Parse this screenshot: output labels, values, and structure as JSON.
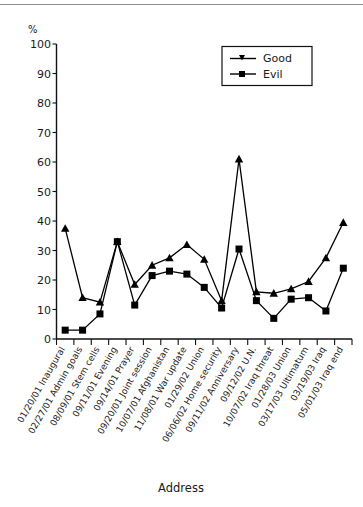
{
  "chart_data": {
    "type": "line",
    "title": "",
    "xlabel": "Address",
    "ylabel": "%",
    "ylim": [
      0,
      100
    ],
    "yticks": [
      0,
      10,
      20,
      30,
      40,
      50,
      60,
      70,
      80,
      90,
      100
    ],
    "grid": false,
    "legend_position": "top-right",
    "categories": [
      "01/20/01 Inaugural",
      "02/27/01 Admin goals",
      "08/09/01 Stem cells",
      "09/11/01 Evening",
      "09/14/01 Prayer",
      "09/20/01 Joint session",
      "10/07/01 Afghanistan",
      "11/08/01 War update",
      "01/29/02 Union",
      "06/06/02 Home security",
      "09/11/02 Anniversary",
      "09/12/02 U.N.",
      "10/07/02 Iraq threat",
      "01/28/03 Union",
      "03/17/03 Ultimatum",
      "03/19/03 Iraq",
      "05/01/03 Iraq end"
    ],
    "series": [
      {
        "name": "Good",
        "marker": "triangle",
        "color": "#000000",
        "values": [
          37.5,
          14,
          12.5,
          33,
          18.5,
          25,
          27.5,
          32,
          27,
          13,
          61,
          16,
          15.5,
          17,
          19.5,
          27.5,
          39.5
        ]
      },
      {
        "name": "Evil",
        "marker": "square",
        "color": "#000000",
        "values": [
          3,
          3,
          8.5,
          33,
          11.5,
          21.5,
          23,
          22,
          17.5,
          10.5,
          30.5,
          13,
          7,
          13.5,
          14,
          9.5,
          24
        ]
      }
    ]
  },
  "legend": {
    "entries": [
      {
        "label": "Good"
      },
      {
        "label": "Evil"
      }
    ]
  },
  "axis": {
    "y_unit_label": "%",
    "x_axis_title": "Address"
  }
}
